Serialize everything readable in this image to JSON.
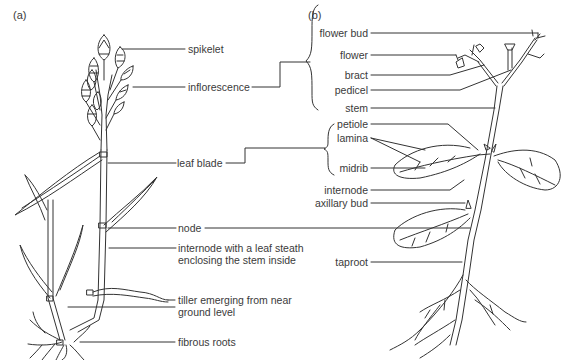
{
  "panels": {
    "a": {
      "tag": "(a)"
    },
    "b": {
      "tag": "(b)"
    }
  },
  "labels_a": {
    "spikelet": "spikelet",
    "inflorescence": "inflorescence",
    "leaf_blade": "leaf blade",
    "node": "node",
    "internode_1": "internode with a leaf steath",
    "internode_2": "enclosing the stem inside",
    "tiller_1": "tiller emerging from near",
    "tiller_2": "ground level",
    "fibrous_roots": "fibrous roots"
  },
  "labels_b": {
    "flower_bud": "flower bud",
    "flower": "flower",
    "bract": "bract",
    "pedicel": "pedicel",
    "stem": "stem",
    "petiole": "petiole",
    "lamina": "lamina",
    "midrib": "midrib",
    "internode": "internode",
    "axillary_bud": "axillary bud",
    "taproot": "taproot"
  },
  "colors": {
    "line": "#333333",
    "text": "#3a3a3a",
    "background": "#ffffff"
  }
}
